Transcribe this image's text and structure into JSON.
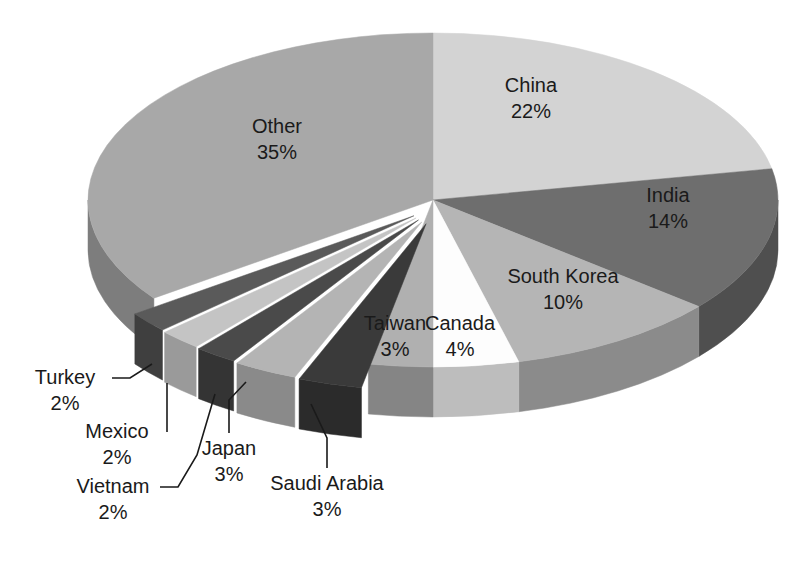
{
  "chart_data": {
    "type": "pie",
    "title": "",
    "subtitle": "",
    "xlabel": "",
    "ylabel": "",
    "legend_position": "none",
    "grid": false,
    "style": "3d-exploded-pie",
    "units": "percent",
    "total": 100,
    "categories": [
      "China",
      "India",
      "South Korea",
      "Canada",
      "Taiwan",
      "Saudi Arabia",
      "Japan",
      "Vietnam",
      "Mexico",
      "Turkey",
      "Other"
    ],
    "values": [
      22,
      14,
      10,
      4,
      3,
      3,
      3,
      2,
      2,
      2,
      35
    ],
    "slices": [
      {
        "name": "China",
        "value": 22,
        "label": "China",
        "value_label": "22%",
        "color": "#d3d3d3",
        "side_color": "#a9a9a9",
        "label_kind": "inside",
        "label_x": 531,
        "label_y": 92,
        "exploded": false
      },
      {
        "name": "India",
        "value": 14,
        "label": "India",
        "value_label": "14%",
        "color": "#6e6e6e",
        "side_color": "#4f4f4f",
        "label_kind": "inside",
        "label_x": 668,
        "label_y": 202,
        "exploded": false
      },
      {
        "name": "South Korea",
        "value": 10,
        "label": "South Korea",
        "value_label": "10%",
        "color": "#b5b5b5",
        "side_color": "#8b8b8b",
        "label_kind": "inside",
        "label_x": 563,
        "label_y": 283,
        "exploded": false
      },
      {
        "name": "Canada",
        "value": 4,
        "label": "Canada",
        "value_label": "4%",
        "color": "#fdfdfd",
        "side_color": "#bdbdbd",
        "label_kind": "inside",
        "label_x": 460,
        "label_y": 330,
        "exploded": false
      },
      {
        "name": "Taiwan",
        "value": 3,
        "label": "Taiwan",
        "value_label": "3%",
        "color": "#b0b0b0",
        "side_color": "#858585",
        "label_kind": "inside",
        "label_x": 395,
        "label_y": 330,
        "exploded": false
      },
      {
        "name": "Saudi Arabia",
        "value": 3,
        "label": "Saudi Arabia",
        "value_label": "3%",
        "color": "#3a3a3a",
        "side_color": "#2b2b2b",
        "label_kind": "callout",
        "label_x": 327,
        "label_y": 490,
        "leader": [
          [
            327,
            468
          ],
          [
            327,
            438
          ],
          [
            311,
            404
          ]
        ],
        "exploded": true
      },
      {
        "name": "Japan",
        "value": 3,
        "label": "Japan",
        "value_label": "3%",
        "color": "#b4b4b4",
        "side_color": "#8a8a8a",
        "label_kind": "callout",
        "label_x": 229,
        "label_y": 455,
        "leader": [
          [
            229,
            433
          ],
          [
            229,
            400
          ],
          [
            246,
            382
          ]
        ],
        "exploded": true
      },
      {
        "name": "Vietnam",
        "value": 2,
        "label": "Vietnam",
        "value_label": "2%",
        "color": "#4a4a4a",
        "side_color": "#343434",
        "label_kind": "callout",
        "label_x": 113,
        "label_y": 493,
        "leader": [
          [
            160,
            487
          ],
          [
            178,
            487
          ],
          [
            197,
            455
          ],
          [
            215,
            394
          ]
        ],
        "exploded": true
      },
      {
        "name": "Mexico",
        "value": 2,
        "label": "Mexico",
        "value_label": "2%",
        "color": "#c4c4c4",
        "side_color": "#9a9a9a",
        "label_kind": "callout",
        "label_x": 117,
        "label_y": 438,
        "leader": [
          [
            167,
            432
          ],
          [
            167,
            420
          ],
          [
            167,
            383
          ]
        ],
        "exploded": true
      },
      {
        "name": "Turkey",
        "value": 2,
        "label": "Turkey",
        "value_label": "2%",
        "color": "#5a5a5a",
        "side_color": "#3f3f3f",
        "label_kind": "callout",
        "label_x": 65,
        "label_y": 384,
        "leader": [
          [
            112,
            378
          ],
          [
            130,
            378
          ],
          [
            152,
            364
          ]
        ],
        "exploded": true
      },
      {
        "name": "Other",
        "value": 35,
        "label": "Other",
        "value_label": "35%",
        "color": "#a8a8a8",
        "side_color": "#7d7d7d",
        "label_kind": "inside",
        "label_x": 277,
        "label_y": 133,
        "exploded": false
      }
    ],
    "geometry": {
      "center_x": 433,
      "center_y": 200,
      "radius_x": 345,
      "radius_y": 167,
      "depth": 50,
      "start_angle_deg": -90,
      "direction": "clockwise"
    },
    "colors": {
      "background": "#ffffff",
      "text": "#1a1a1a",
      "leader_line": "#1a1a1a"
    }
  }
}
